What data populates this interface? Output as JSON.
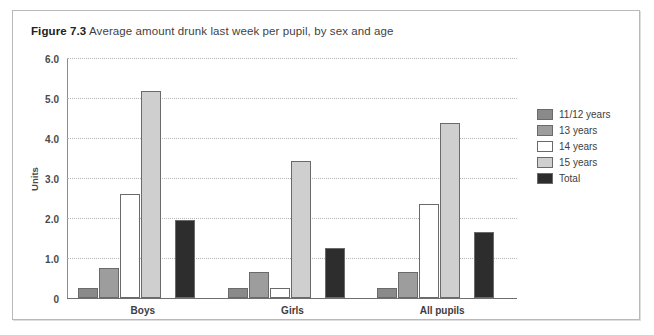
{
  "figure": {
    "number": "Figure 7.3",
    "caption": "Average amount drunk last week per pupil, by sex and age"
  },
  "chart_data": {
    "type": "bar",
    "title": "Average amount drunk last week per pupil, by sex and age",
    "xlabel": "",
    "ylabel": "Units",
    "ylim": [
      0,
      6
    ],
    "yticks": [
      "0",
      "1.0",
      "2.0",
      "3.0",
      "4.0",
      "5.0",
      "6.0"
    ],
    "ytick_values": [
      0,
      1,
      2,
      3,
      4,
      5,
      6
    ],
    "grid": true,
    "legend_position": "right",
    "categories": [
      "Boys",
      "Girls",
      "All pupils"
    ],
    "series": [
      {
        "name": "11/12 years",
        "color": "#8a8a8a",
        "values": [
          0.25,
          0.25,
          0.25
        ]
      },
      {
        "name": "13 years",
        "color": "#9d9d9d",
        "values": [
          0.75,
          0.65,
          0.65
        ]
      },
      {
        "name": "14 years",
        "color": "#ffffff",
        "values": [
          2.6,
          0.25,
          2.35
        ]
      },
      {
        "name": "15 years",
        "color": "#cfcfcf",
        "values": [
          5.2,
          3.45,
          4.4
        ]
      },
      {
        "name": "Total",
        "color": "#2d2d2d",
        "values": [
          1.95,
          1.25,
          1.65
        ]
      }
    ]
  },
  "colors": {
    "frame_border": "#b9b9b9",
    "grid": "#b5b5b5",
    "axis": "#6f6f6f",
    "bar_outline": "#6a6a6a",
    "text": "#3d3d3d"
  }
}
